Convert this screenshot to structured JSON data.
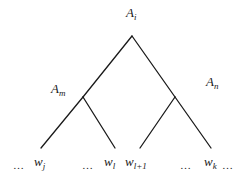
{
  "diagram": {
    "type": "parse-tree",
    "line_color": "#1a1a1a",
    "nodes": {
      "root": {
        "base": "A",
        "sub": "i"
      },
      "left": {
        "base": "A",
        "sub": "m"
      },
      "right": {
        "base": "A",
        "sub": "n"
      }
    },
    "leaves": [
      {
        "kind": "ellipsis",
        "text": "…"
      },
      {
        "kind": "word",
        "base": "w",
        "sub": "j"
      },
      {
        "kind": "ellipsis",
        "text": "…"
      },
      {
        "kind": "word",
        "base": "w",
        "sub": "l"
      },
      {
        "kind": "word",
        "base": "w",
        "sub": "l+1"
      },
      {
        "kind": "ellipsis",
        "text": "…"
      },
      {
        "kind": "word",
        "base": "w",
        "sub": "k"
      },
      {
        "kind": "ellipsis",
        "text": "…"
      }
    ],
    "edges": [
      {
        "from": "A_i",
        "to": "A_m"
      },
      {
        "from": "A_i",
        "to": "A_n"
      },
      {
        "from": "A_m",
        "to": "w_j"
      },
      {
        "from": "A_m",
        "to": "w_l"
      },
      {
        "from": "A_n",
        "to": "w_l+1"
      },
      {
        "from": "A_n",
        "to": "w_k"
      }
    ]
  }
}
